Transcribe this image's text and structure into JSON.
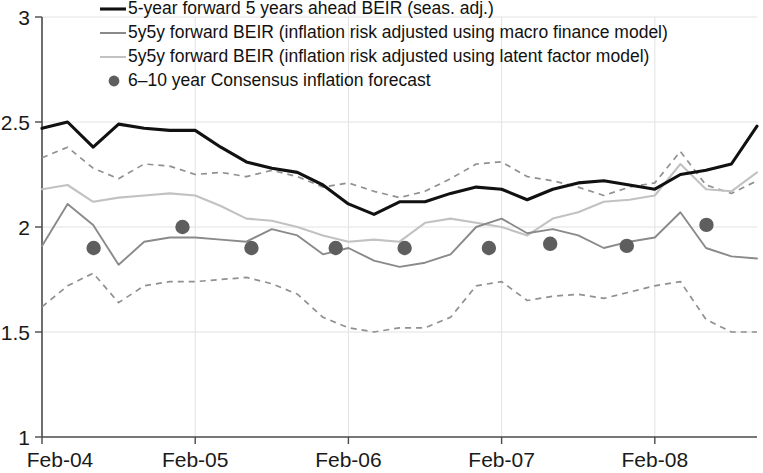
{
  "chart_data": {
    "type": "line",
    "title": "",
    "subtitle": "",
    "xlabel": "",
    "ylabel": "",
    "xlim": [
      2004.083,
      2008.75
    ],
    "ylim": [
      1,
      3
    ],
    "yticks": [
      1,
      1.5,
      2,
      2.5,
      3
    ],
    "ytick_labels": [
      "1",
      "1.5",
      "2",
      "2.5",
      "3"
    ],
    "xticks": [
      2004.083,
      2005.083,
      2006.083,
      2007.083,
      2008.083
    ],
    "xtick_labels": [
      "Feb-04",
      "Feb-05",
      "Feb-06",
      "Feb-07",
      "Feb-08"
    ],
    "grid": "vertical and horizontal light gridlines",
    "legend_position": "top-center inside plot",
    "legend": [
      {
        "label": "5-year forward 5 years ahead BEIR (seas. adj.)",
        "marker": "thick-solid-line",
        "color": "#111111"
      },
      {
        "label": "5y5y forward BEIR (inflation risk adjusted using macro finance model)",
        "marker": "solid-line",
        "color": "#8a8a8a"
      },
      {
        "label": "5y5y forward BEIR (inflation risk adjusted using latent factor model)",
        "marker": "solid-line",
        "color": "#c2c2c2"
      },
      {
        "label": "6–10 year Consensus inflation forecast",
        "marker": "dot",
        "color": "#5e5e5e"
      }
    ],
    "series": [
      {
        "name": "5-year forward 5 years ahead BEIR (seas. adj.)",
        "style": "solid",
        "color": "#111111",
        "x": [
          2004.083,
          2004.25,
          2004.417,
          2004.583,
          2004.75,
          2004.917,
          2005.083,
          2005.25,
          2005.417,
          2005.583,
          2005.75,
          2005.917,
          2006.083,
          2006.25,
          2006.417,
          2006.583,
          2006.75,
          2006.917,
          2007.083,
          2007.25,
          2007.417,
          2007.583,
          2007.75,
          2007.917,
          2008.083,
          2008.25,
          2008.417,
          2008.583,
          2008.75
        ],
        "values": [
          2.47,
          2.5,
          2.38,
          2.49,
          2.47,
          2.46,
          2.46,
          2.38,
          2.31,
          2.28,
          2.26,
          2.2,
          2.11,
          2.06,
          2.12,
          2.12,
          2.16,
          2.19,
          2.18,
          2.13,
          2.18,
          2.21,
          2.22,
          2.2,
          2.18,
          2.25,
          2.27,
          2.3,
          2.48
        ]
      },
      {
        "name": "5y5y forward BEIR (inflation risk adjusted using macro finance model)",
        "style": "solid",
        "color": "#8a8a8a",
        "x": [
          2004.083,
          2004.25,
          2004.417,
          2004.583,
          2004.75,
          2004.917,
          2005.083,
          2005.25,
          2005.417,
          2005.583,
          2005.75,
          2005.917,
          2006.083,
          2006.25,
          2006.417,
          2006.583,
          2006.75,
          2006.917,
          2007.083,
          2007.25,
          2007.417,
          2007.583,
          2007.75,
          2007.917,
          2008.083,
          2008.25,
          2008.417,
          2008.583,
          2008.75
        ],
        "values": [
          1.91,
          2.11,
          2.01,
          1.82,
          1.93,
          1.95,
          1.95,
          1.94,
          1.93,
          1.99,
          1.96,
          1.87,
          1.9,
          1.84,
          1.81,
          1.83,
          1.87,
          2.0,
          2.04,
          1.97,
          1.99,
          1.96,
          1.9,
          1.93,
          1.95,
          2.07,
          1.9,
          1.86,
          1.85
        ]
      },
      {
        "name": "5y5y forward BEIR (inflation risk adjusted using latent factor model)",
        "style": "solid",
        "color": "#c2c2c2",
        "x": [
          2004.083,
          2004.25,
          2004.417,
          2004.583,
          2004.75,
          2004.917,
          2005.083,
          2005.25,
          2005.417,
          2005.583,
          2005.75,
          2005.917,
          2006.083,
          2006.25,
          2006.417,
          2006.583,
          2006.75,
          2006.917,
          2007.083,
          2007.25,
          2007.417,
          2007.583,
          2007.75,
          2007.917,
          2008.083,
          2008.25,
          2008.417,
          2008.583,
          2008.75
        ],
        "values": [
          2.18,
          2.2,
          2.12,
          2.14,
          2.15,
          2.16,
          2.15,
          2.1,
          2.04,
          2.03,
          2.0,
          1.96,
          1.93,
          1.94,
          1.93,
          2.02,
          2.04,
          2.02,
          2.0,
          1.96,
          2.04,
          2.07,
          2.12,
          2.13,
          2.15,
          2.3,
          2.18,
          2.17,
          2.26
        ]
      },
      {
        "name": "upper confidence band",
        "style": "dashed",
        "color": "#909090",
        "x": [
          2004.083,
          2004.25,
          2004.417,
          2004.583,
          2004.75,
          2004.917,
          2005.083,
          2005.25,
          2005.417,
          2005.583,
          2005.75,
          2005.917,
          2006.083,
          2006.25,
          2006.417,
          2006.583,
          2006.75,
          2006.917,
          2007.083,
          2007.25,
          2007.417,
          2007.583,
          2007.75,
          2007.917,
          2008.083,
          2008.25,
          2008.417,
          2008.583,
          2008.75
        ],
        "values": [
          2.33,
          2.38,
          2.28,
          2.23,
          2.3,
          2.29,
          2.25,
          2.26,
          2.24,
          2.27,
          2.24,
          2.19,
          2.21,
          2.17,
          2.14,
          2.17,
          2.23,
          2.3,
          2.31,
          2.24,
          2.22,
          2.19,
          2.15,
          2.19,
          2.21,
          2.36,
          2.2,
          2.16,
          2.22
        ]
      },
      {
        "name": "lower confidence band",
        "style": "dashed",
        "color": "#909090",
        "x": [
          2004.083,
          2004.25,
          2004.417,
          2004.583,
          2004.75,
          2004.917,
          2005.083,
          2005.25,
          2005.417,
          2005.583,
          2005.75,
          2005.917,
          2006.083,
          2006.25,
          2006.417,
          2006.583,
          2006.75,
          2006.917,
          2007.083,
          2007.25,
          2007.417,
          2007.583,
          2007.75,
          2007.917,
          2008.083,
          2008.25,
          2008.417,
          2008.583,
          2008.75
        ],
        "values": [
          1.62,
          1.72,
          1.78,
          1.64,
          1.72,
          1.74,
          1.74,
          1.75,
          1.76,
          1.73,
          1.68,
          1.57,
          1.52,
          1.5,
          1.52,
          1.52,
          1.57,
          1.72,
          1.74,
          1.65,
          1.67,
          1.68,
          1.66,
          1.69,
          1.72,
          1.74,
          1.56,
          1.5,
          1.5
        ]
      }
    ],
    "scatter": {
      "name": "6–10 year Consensus inflation forecast",
      "color": "#5e5e5e",
      "marker": "filled-circle",
      "x": [
        2004.42,
        2005.0,
        2005.45,
        2006.0,
        2006.45,
        2007.0,
        2007.4,
        2007.9,
        2008.42
      ],
      "values": [
        1.9,
        2.0,
        1.9,
        1.9,
        1.9,
        1.9,
        1.92,
        1.91,
        2.01
      ]
    }
  }
}
